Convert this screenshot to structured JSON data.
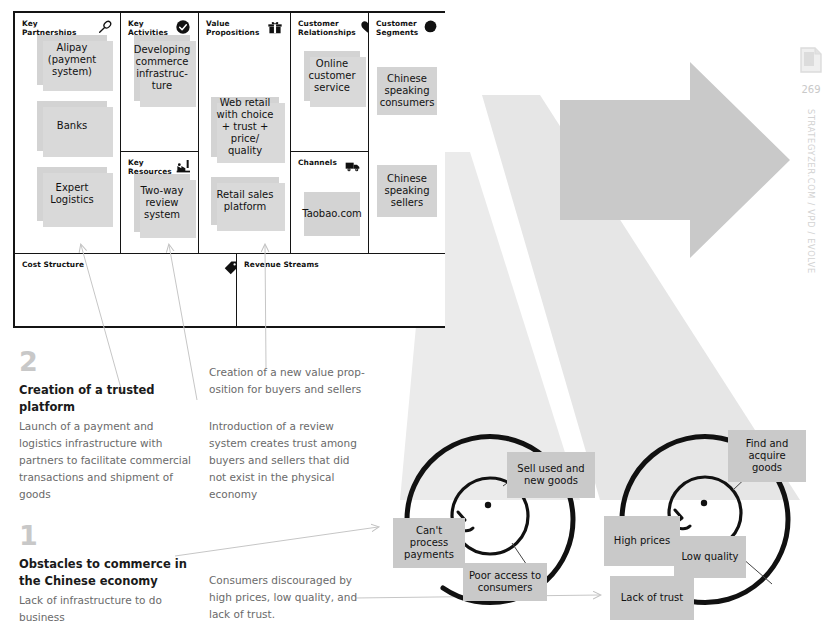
{
  "page": {
    "number": "269",
    "rail_text": "STRATEGYZER.COM / VPD / EVOLVE",
    "page_icon": "document-page-icon"
  },
  "canvas": {
    "blocks": [
      {
        "id": "key-partnerships",
        "title": "Key Partnerships",
        "icon": "chain-link-icon",
        "notes": [
          "Alipay (payment system)",
          "Banks",
          "Expert Logistics"
        ]
      },
      {
        "id": "key-activities",
        "title": "Key Activities",
        "icon": "check-circle-icon",
        "notes": [
          "Developing commerce infrastruc-ture"
        ]
      },
      {
        "id": "key-resources",
        "title": "Key Resources",
        "icon": "factory-icon",
        "notes": [
          "Two-way review system"
        ]
      },
      {
        "id": "value-propositions",
        "title": "Value Propositions",
        "icon": "gift-box-icon",
        "notes": [
          "Web retail with choice + trust + price/ quality",
          "Retail sales platform"
        ]
      },
      {
        "id": "customer-relationships",
        "title": "Customer Relationships",
        "icon": "heart-icon",
        "notes": [
          "Online customer service"
        ]
      },
      {
        "id": "channels",
        "title": "Channels",
        "icon": "delivery-truck-icon",
        "notes": [
          "Taobao.com"
        ]
      },
      {
        "id": "customer-segments",
        "title": "Customer Segments",
        "icon": "person-head-icon",
        "notes": [
          "Chinese speaking consumers",
          "Chinese speaking sellers"
        ]
      },
      {
        "id": "cost-structure",
        "title": "Cost Structure",
        "icon": "price-tag-icon",
        "notes": []
      },
      {
        "id": "revenue-streams",
        "title": "Revenue Streams",
        "icon": "",
        "notes": []
      }
    ]
  },
  "annotations": {
    "step2": {
      "number": "2",
      "heading": "Creation of a trusted platform",
      "body": "Launch of a payment and logistics infrastructure with partners to facilitate commercial transactions and shipment of goods"
    },
    "step1": {
      "number": "1",
      "heading": "Obstacles to commerce in the Chinese economy",
      "body": "Lack of infrastructure to do business"
    },
    "note_valueprop": "Creation of a new value prop-osition for buyers and sellers",
    "note_review": "Introduction of a review system creates trust among buyers and sellers that did not exist in the physical economy",
    "note_consumers": "Consumers discouraged by high prices, low quality, and lack of trust."
  },
  "circles": {
    "seller": {
      "id": "seller-circle",
      "labels": [
        "Sell used and new goods",
        "Can't process payments",
        "Poor access to consumers"
      ]
    },
    "buyer": {
      "id": "buyer-circle",
      "labels": [
        "Find and acquire goods",
        "High prices",
        "Low quality",
        "Lack of trust"
      ]
    }
  },
  "colors": {
    "note_fill": "#d3d3d3",
    "note_shadow": "#d9d9d9",
    "ink": "#141414",
    "muted_text": "#6a6a6a",
    "big_number": "#c8c8c8",
    "arrow_gray": "#c4c4c4",
    "funnel_gray": "#e9e9e9",
    "rail_gray": "#d2d2d2"
  }
}
